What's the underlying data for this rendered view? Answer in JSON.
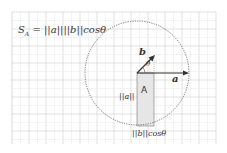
{
  "formula": "S_A = ||a||||b||cosθ",
  "formula_parts": {
    "s": "S",
    "sub": "A",
    "rest": " = ||a||||b||cosθ"
  },
  "labels": {
    "vector_a": "a",
    "vector_b": "b",
    "angle": "θ",
    "area": "A",
    "side_a": "||a||",
    "side_b": "||b||cosθ"
  },
  "colors": {
    "grid_major": "#cfcfcf",
    "grid_minor": "#ececec",
    "shade": "#e4e4e4",
    "ink": "#333333"
  }
}
